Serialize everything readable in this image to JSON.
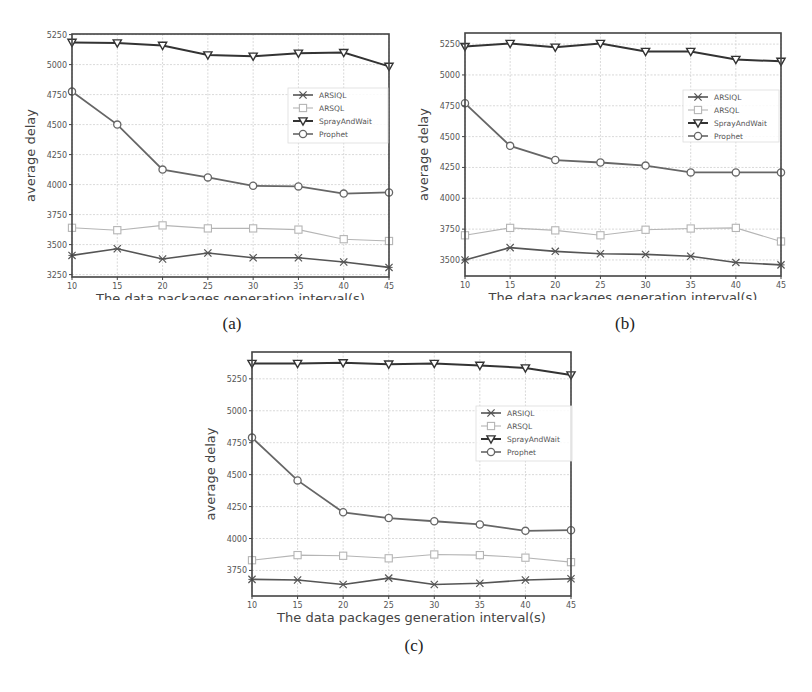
{
  "figure": {
    "captions": [
      "(a)",
      "(b)",
      "(c)"
    ]
  },
  "chart_data": [
    {
      "type": "line",
      "id": "a",
      "caption": "(a)",
      "title": "",
      "xlabel": "The data packages generation interval(s)",
      "ylabel": "average delay",
      "x": [
        10,
        15,
        20,
        25,
        30,
        35,
        40,
        45
      ],
      "xticks": [
        10,
        15,
        20,
        25,
        30,
        35,
        40,
        45
      ],
      "yticks": [
        3250,
        3500,
        3750,
        4000,
        4250,
        4500,
        4750,
        5000,
        5250
      ],
      "ylim": [
        3230,
        5255
      ],
      "xlim": [
        10,
        45
      ],
      "grid": true,
      "legend_position": "center right",
      "series": [
        {
          "name": "ARSIQL",
          "marker": "x",
          "color": "#555555",
          "values": [
            3410,
            3465,
            3380,
            3430,
            3390,
            3390,
            3355,
            3310
          ]
        },
        {
          "name": "ARSQL",
          "marker": "square-open",
          "color": "#b5b5b5",
          "values": [
            3640,
            3620,
            3660,
            3635,
            3635,
            3625,
            3545,
            3530
          ]
        },
        {
          "name": "SprayAndWait",
          "marker": "triangle-down",
          "color": "#333333",
          "values": [
            5185,
            5180,
            5160,
            5080,
            5070,
            5095,
            5100,
            4985
          ]
        },
        {
          "name": "Prophet",
          "marker": "circle-open",
          "color": "#666666",
          "values": [
            4775,
            4500,
            4125,
            4060,
            3990,
            3985,
            3925,
            3935
          ]
        }
      ]
    },
    {
      "type": "line",
      "id": "b",
      "caption": "(b)",
      "title": "",
      "xlabel": "The data packages generation interval(s)",
      "ylabel": "average delay",
      "x": [
        10,
        15,
        20,
        25,
        30,
        35,
        40,
        45
      ],
      "xticks": [
        10,
        15,
        20,
        25,
        30,
        35,
        40,
        45
      ],
      "yticks": [
        3500,
        3750,
        4000,
        4250,
        4500,
        4750,
        5000,
        5250
      ],
      "ylim": [
        3370,
        5340
      ],
      "xlim": [
        10,
        45
      ],
      "grid": true,
      "legend_position": "center right",
      "series": [
        {
          "name": "ARSIQL",
          "marker": "x",
          "color": "#555555",
          "values": [
            3500,
            3600,
            3570,
            3550,
            3545,
            3530,
            3480,
            3460
          ]
        },
        {
          "name": "ARSQL",
          "marker": "square-open",
          "color": "#b5b5b5",
          "values": [
            3700,
            3760,
            3740,
            3700,
            3745,
            3755,
            3760,
            3650
          ]
        },
        {
          "name": "SprayAndWait",
          "marker": "triangle-down",
          "color": "#333333",
          "values": [
            5230,
            5255,
            5225,
            5255,
            5190,
            5190,
            5125,
            5110
          ]
        },
        {
          "name": "Prophet",
          "marker": "circle-open",
          "color": "#666666",
          "values": [
            4770,
            4425,
            4310,
            4290,
            4265,
            4210,
            4210,
            4210
          ]
        }
      ]
    },
    {
      "type": "line",
      "id": "c",
      "caption": "(c)",
      "title": "",
      "xlabel": "The data packages generation interval(s)",
      "ylabel": "average delay",
      "x": [
        10,
        15,
        20,
        25,
        30,
        35,
        40,
        45
      ],
      "xticks": [
        10,
        15,
        20,
        25,
        30,
        35,
        40,
        45
      ],
      "yticks": [
        3750,
        4000,
        4250,
        4500,
        4750,
        5000,
        5250
      ],
      "ylim": [
        3550,
        5460
      ],
      "xlim": [
        10,
        45
      ],
      "grid": true,
      "legend_position": "center right",
      "series": [
        {
          "name": "ARSIQL",
          "marker": "x",
          "color": "#555555",
          "values": [
            3680,
            3675,
            3640,
            3690,
            3640,
            3650,
            3675,
            3685
          ]
        },
        {
          "name": "ARSQL",
          "marker": "square-open",
          "color": "#b5b5b5",
          "values": [
            3830,
            3870,
            3865,
            3845,
            3875,
            3870,
            3850,
            3815
          ]
        },
        {
          "name": "SprayAndWait",
          "marker": "triangle-down",
          "color": "#333333",
          "values": [
            5370,
            5370,
            5375,
            5365,
            5370,
            5355,
            5335,
            5280
          ]
        },
        {
          "name": "Prophet",
          "marker": "circle-open",
          "color": "#666666",
          "values": [
            4790,
            4455,
            4205,
            4160,
            4135,
            4110,
            4060,
            4065
          ]
        }
      ]
    }
  ]
}
